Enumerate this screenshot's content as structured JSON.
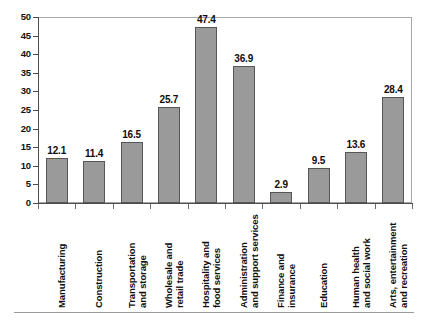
{
  "chart_data": {
    "type": "bar",
    "title": "",
    "subtitle": "",
    "xlabel": "",
    "ylabel": "",
    "ylim": [
      0,
      50
    ],
    "ytick_step": 5,
    "grid": false,
    "legend": null,
    "orientation": "vertical",
    "bar_color": "#9a9a9a",
    "bar_edge_color": "#565656",
    "categories": [
      "Manufacturing",
      "Construction",
      "Transportation and storage",
      "Wholesale and retail trade",
      "Hospitality and food services",
      "Administration and support services",
      "Finance and insurance",
      "Education",
      "Human health and social work",
      "Arts, entertainment and recreation"
    ],
    "category_label_lines": [
      [
        "Manufacturing"
      ],
      [
        "Construction"
      ],
      [
        "Transportation",
        "and storage"
      ],
      [
        "Wholesale and",
        "retail trade"
      ],
      [
        "Hospitality and",
        "food services"
      ],
      [
        "Administration",
        "and support services"
      ],
      [
        "Finance and",
        "insurance"
      ],
      [
        "Education"
      ],
      [
        "Human health",
        "and social work"
      ],
      [
        "Arts, entertainment",
        "and recreation"
      ]
    ],
    "values": [
      12.1,
      11.4,
      16.5,
      25.7,
      47.4,
      36.9,
      2.9,
      9.5,
      13.6,
      28.4
    ],
    "value_labels": [
      "12.1",
      "11.4",
      "16.5",
      "25.7",
      "47.4",
      "36.9",
      "2.9",
      "9.5",
      "13.6",
      "28.4"
    ],
    "yticks": [
      0,
      5,
      10,
      15,
      20,
      25,
      30,
      35,
      40,
      45,
      50
    ],
    "ytick_labels": [
      "0",
      "5",
      "10",
      "15",
      "20",
      "25",
      "30",
      "35",
      "40",
      "45",
      "50"
    ]
  }
}
